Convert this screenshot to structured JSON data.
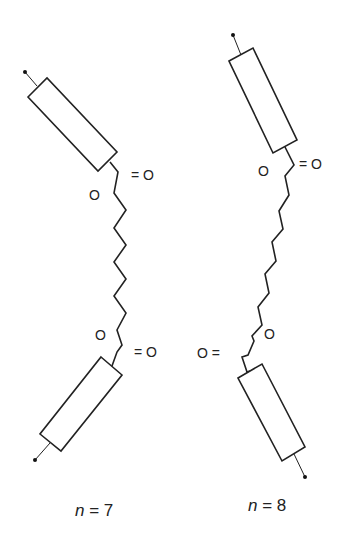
{
  "figure": {
    "molecules": [
      {
        "id": "odd",
        "caption_var": "n",
        "caption_eq": " = ",
        "caption_val": "7",
        "top_ester": {
          "ether_o": "O",
          "carbonyl": "= O"
        },
        "bottom_ester": {
          "ether_o": "O",
          "carbonyl": "= O"
        },
        "spacer_vertices": 11
      },
      {
        "id": "even",
        "caption_var": "n",
        "caption_eq": " = ",
        "caption_val": "8",
        "top_ester": {
          "ether_o": "O",
          "carbonyl": "= O"
        },
        "bottom_ester": {
          "ether_o": "O",
          "carbonyl": "O ="
        },
        "spacer_vertices": 12
      }
    ],
    "colors": {
      "line": "#222222",
      "background": "#ffffff"
    }
  }
}
